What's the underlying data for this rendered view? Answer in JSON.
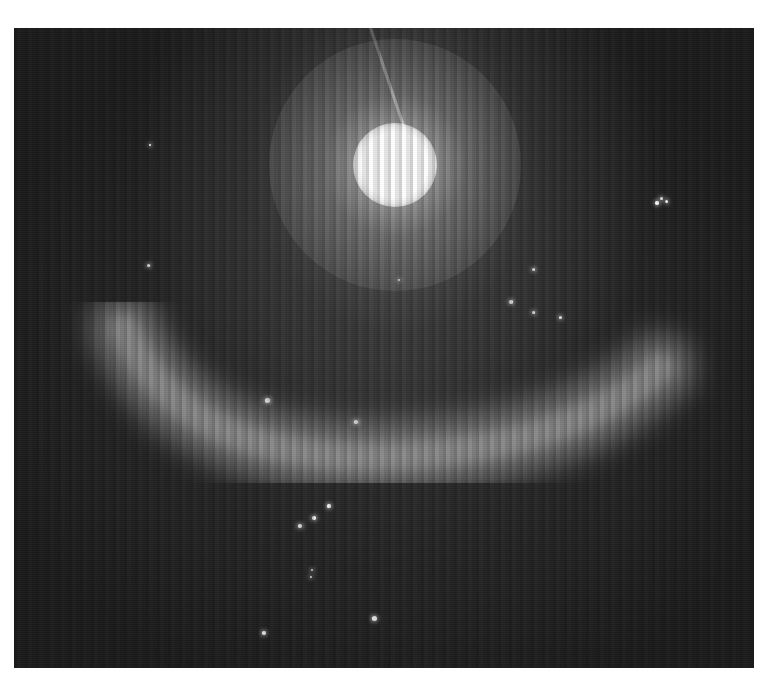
{
  "image": {
    "description": "Grayscale astronomical image: bright saturated star near top with a diffraction spike, a glowing curved arc (ring) below it, and scattered faint point-like stars",
    "frame": {
      "left": 14,
      "top": 28,
      "width": 740,
      "height": 640
    },
    "colors": {
      "background": "#1e1e1e",
      "border": "#ffffff",
      "star": "#ffffff",
      "arc": "#b4b4b4"
    },
    "bright_star": {
      "cx": 381,
      "cy": 137,
      "radius": 42
    },
    "spike": {
      "x1": 426,
      "y1": 0,
      "x2": 391,
      "y2": 104
    },
    "arc": {
      "path": "M 110 300 Q 170 440 390 428 Q 560 418 646 340"
    },
    "stars": [
      {
        "x": 253,
        "y": 372,
        "r": 2.5
      },
      {
        "x": 342,
        "y": 394,
        "r": 1.8
      },
      {
        "x": 497,
        "y": 274,
        "r": 2
      },
      {
        "x": 519,
        "y": 241,
        "r": 1.5
      },
      {
        "x": 519,
        "y": 284,
        "r": 1.5
      },
      {
        "x": 546,
        "y": 289,
        "r": 1.5
      },
      {
        "x": 360,
        "y": 590,
        "r": 2.5
      },
      {
        "x": 250,
        "y": 605,
        "r": 2
      },
      {
        "x": 286,
        "y": 498,
        "r": 1.8
      },
      {
        "x": 300,
        "y": 490,
        "r": 1.8
      },
      {
        "x": 315,
        "y": 478,
        "r": 1.6
      },
      {
        "x": 134,
        "y": 237,
        "r": 1.5
      },
      {
        "x": 136,
        "y": 117,
        "r": 1.3
      },
      {
        "x": 643,
        "y": 175,
        "r": 1.8
      },
      {
        "x": 652,
        "y": 173,
        "r": 1.5
      },
      {
        "x": 647,
        "y": 170,
        "r": 1.5
      },
      {
        "x": 297,
        "y": 549,
        "r": 1.2
      },
      {
        "x": 298,
        "y": 542,
        "r": 1.2
      },
      {
        "x": 385,
        "y": 252,
        "r": 1.2
      }
    ]
  }
}
